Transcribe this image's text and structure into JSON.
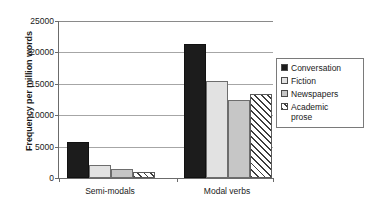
{
  "chart_data": {
    "type": "bar",
    "title": "",
    "xlabel": "",
    "ylabel": "Frequency per million words",
    "categories": [
      "Semi-modals",
      "Modal verbs"
    ],
    "ylim": [
      0,
      25000
    ],
    "yticks": [
      0,
      5000,
      10000,
      15000,
      20000,
      25000
    ],
    "ytick_labels": [
      "0",
      "5000",
      "10000",
      "15000",
      "20000",
      "25000"
    ],
    "grid": true,
    "legend_position": "right",
    "series": [
      {
        "name": "Conversation",
        "values": [
          5700,
          21400
        ],
        "swatch": "solid-black",
        "color": "#1c1c1c"
      },
      {
        "name": "Fiction",
        "values": [
          2100,
          15400
        ],
        "swatch": "solid-light",
        "color": "#e2e2e2"
      },
      {
        "name": "Newspapers",
        "values": [
          1500,
          12400
        ],
        "swatch": "solid-gray",
        "color": "#c6c6c6"
      },
      {
        "name": "Academic\nprose",
        "values": [
          900,
          13400
        ],
        "swatch": "diagonal-hatch",
        "color": "#ffffff"
      }
    ]
  },
  "legend": {
    "items": [
      {
        "label": "Conversation"
      },
      {
        "label": "Fiction"
      },
      {
        "label": "Newspapers"
      },
      {
        "label": "Academic\nprose"
      }
    ]
  }
}
